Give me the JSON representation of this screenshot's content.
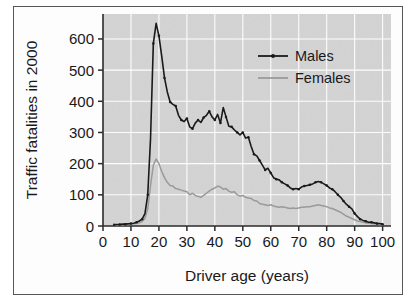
{
  "chart_data": {
    "type": "line",
    "title": "",
    "xlabel": "Driver age (years)",
    "ylabel": "Traffic fatalities in 2000",
    "xlim": [
      0,
      103
    ],
    "ylim": [
      0,
      680
    ],
    "xticks": [
      0,
      10,
      20,
      30,
      40,
      50,
      60,
      70,
      80,
      90,
      100
    ],
    "yticks": [
      0,
      100,
      200,
      300,
      400,
      500,
      600
    ],
    "xtick_labels": [
      "0",
      "10",
      "20",
      "30",
      "40",
      "50",
      "60",
      "70",
      "80",
      "90",
      "100"
    ],
    "ytick_labels": [
      "0",
      "100",
      "200",
      "300",
      "400",
      "500",
      "600"
    ],
    "grid": true,
    "grid_color": "#ffffff",
    "plot_background": "#d4d4d4",
    "legend_position": "upper right",
    "legend": [
      "Males",
      "Females"
    ],
    "x": [
      4,
      5,
      6,
      7,
      8,
      9,
      10,
      11,
      12,
      13,
      14,
      15,
      16,
      17,
      18,
      19,
      20,
      21,
      22,
      23,
      24,
      25,
      26,
      27,
      28,
      29,
      30,
      31,
      32,
      33,
      34,
      35,
      36,
      37,
      38,
      39,
      40,
      41,
      42,
      43,
      44,
      45,
      46,
      47,
      48,
      49,
      50,
      51,
      52,
      53,
      54,
      55,
      56,
      57,
      58,
      59,
      60,
      61,
      62,
      63,
      64,
      65,
      66,
      67,
      68,
      69,
      70,
      71,
      72,
      73,
      74,
      75,
      76,
      77,
      78,
      79,
      80,
      81,
      82,
      83,
      84,
      85,
      86,
      87,
      88,
      89,
      90,
      91,
      92,
      93,
      94,
      95,
      96,
      97,
      98,
      99,
      100
    ],
    "series": [
      {
        "name": "Males",
        "color": "#1a1a1a",
        "line_width": 1.6,
        "markers": true,
        "values": [
          4,
          5,
          5,
          6,
          6,
          7,
          8,
          9,
          12,
          16,
          22,
          40,
          100,
          280,
          585,
          650,
          610,
          545,
          475,
          430,
          398,
          390,
          385,
          355,
          340,
          335,
          345,
          318,
          312,
          330,
          340,
          332,
          348,
          355,
          368,
          350,
          340,
          358,
          330,
          380,
          350,
          320,
          318,
          308,
          300,
          292,
          300,
          282,
          285,
          255,
          230,
          225,
          210,
          195,
          180,
          185,
          170,
          155,
          150,
          148,
          140,
          135,
          130,
          122,
          118,
          120,
          118,
          125,
          128,
          130,
          132,
          135,
          140,
          143,
          140,
          135,
          130,
          122,
          118,
          110,
          100,
          92,
          80,
          70,
          62,
          55,
          40,
          30,
          22,
          18,
          15,
          12,
          12,
          10,
          8,
          8,
          6
        ]
      },
      {
        "name": "Females",
        "color": "#9a9a9a",
        "line_width": 1.5,
        "markers": false,
        "values": [
          3,
          3,
          4,
          4,
          5,
          5,
          6,
          7,
          8,
          10,
          14,
          25,
          55,
          130,
          195,
          215,
          200,
          175,
          155,
          140,
          130,
          128,
          120,
          118,
          115,
          112,
          110,
          100,
          105,
          98,
          95,
          92,
          98,
          105,
          112,
          118,
          122,
          128,
          125,
          118,
          120,
          112,
          108,
          110,
          100,
          96,
          98,
          92,
          90,
          88,
          82,
          80,
          72,
          70,
          68,
          66,
          68,
          64,
          62,
          60,
          62,
          60,
          58,
          56,
          58,
          56,
          58,
          60,
          60,
          62,
          62,
          64,
          66,
          68,
          66,
          64,
          62,
          58,
          56,
          52,
          48,
          44,
          38,
          32,
          28,
          24,
          20,
          16,
          14,
          12,
          10,
          9,
          8,
          7,
          6,
          5,
          4
        ]
      }
    ]
  },
  "axes": {
    "xlabel": "Driver age (years)",
    "ylabel": "Traffic fatalities in 2000"
  },
  "legend": {
    "items": [
      {
        "label": "Males",
        "color": "#1a1a1a"
      },
      {
        "label": "Females",
        "color": "#9a9a9a"
      }
    ]
  }
}
